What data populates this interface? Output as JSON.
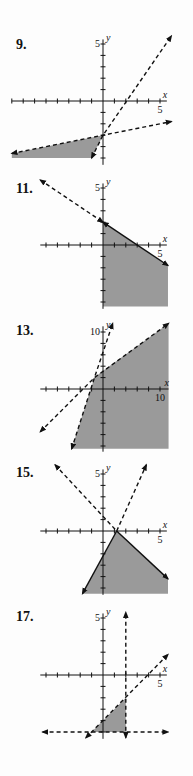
{
  "problems": [
    {
      "number": "9.",
      "top": 37
    },
    {
      "number": "11.",
      "top": 181
    },
    {
      "number": "13.",
      "top": 323
    },
    {
      "number": "15.",
      "top": 465
    },
    {
      "number": "17.",
      "top": 609
    }
  ],
  "style": {
    "shade": "#9a9a9a",
    "line": "#111111"
  },
  "chart_data": [
    {
      "type": "line",
      "title": "9.",
      "xlabel": "x",
      "ylabel": "y",
      "xlim": [
        -8,
        6
      ],
      "ylim": [
        -6,
        5
      ],
      "tick_labels": {
        "x": "5",
        "y": "5"
      },
      "series": [
        {
          "name": "boundary 1",
          "style": "dashed",
          "points": [
            [
              -8,
              -4.6
            ],
            [
              0,
              -3
            ],
            [
              6,
              -1.8
            ]
          ]
        },
        {
          "name": "boundary 2",
          "style": "dashed",
          "points": [
            [
              -1,
              -5
            ],
            [
              0,
              -3
            ],
            [
              6,
              5.7
            ]
          ]
        }
      ],
      "shaded_region": [
        [
          -8,
          -4.6
        ],
        [
          0,
          -3
        ],
        [
          -1,
          -5
        ],
        [
          -8,
          -5
        ]
      ]
    },
    {
      "type": "line",
      "title": "11.",
      "xlabel": "x",
      "ylabel": "y",
      "xlim": [
        -5,
        6
      ],
      "ylim": [
        -5,
        5
      ],
      "tick_labels": {
        "x": "5",
        "y": "5"
      },
      "series": [
        {
          "name": "boundary dashed",
          "style": "dashed",
          "points": [
            [
              -5.5,
              5.7
            ],
            [
              0,
              2
            ]
          ]
        },
        {
          "name": "boundary solid",
          "style": "solid",
          "points": [
            [
              0,
              2
            ],
            [
              5.7,
              -1.8
            ]
          ]
        }
      ],
      "shaded_region": [
        [
          0,
          2
        ],
        [
          5.7,
          -1.8
        ],
        [
          5.7,
          -5.4
        ],
        [
          0,
          -5.4
        ]
      ]
    },
    {
      "type": "line",
      "title": "13.",
      "xlabel": "x",
      "ylabel": "y",
      "xlim": [
        -10,
        12
      ],
      "ylim": [
        -10,
        12
      ],
      "tick_labels": {
        "x": "10",
        "y": "10"
      },
      "series": [
        {
          "name": "steep boundary",
          "style": "dashed",
          "points": [
            [
              -5.5,
              -10.5
            ],
            [
              -1.5,
              2
            ],
            [
              1.7,
              11.5
            ]
          ]
        },
        {
          "name": "shallow boundary",
          "style": "dashed",
          "points": [
            [
              -11,
              -7.5
            ],
            [
              -1.5,
              2
            ],
            [
              11.5,
              11.5
            ]
          ]
        }
      ],
      "shaded_region": [
        [
          -5.5,
          -10.5
        ],
        [
          -1.5,
          2
        ],
        [
          0,
          3.2
        ],
        [
          11.5,
          11.5
        ],
        [
          11.5,
          -10.5
        ]
      ]
    },
    {
      "type": "line",
      "title": "15.",
      "xlabel": "x",
      "ylabel": "y",
      "xlim": [
        -5,
        6
      ],
      "ylim": [
        -6,
        5
      ],
      "tick_labels": {
        "x": "5",
        "y": "5"
      },
      "series": [
        {
          "name": "descending",
          "style": "dashed-solid",
          "points": [
            [
              -4.2,
              5.8
            ],
            [
              1.2,
              0
            ],
            [
              5.7,
              -4.2
            ]
          ]
        },
        {
          "name": "ascending",
          "style": "dashed-solid",
          "points": [
            [
              -1.8,
              -5.5
            ],
            [
              1.2,
              0
            ],
            [
              3.8,
              5.8
            ]
          ]
        }
      ],
      "shaded_region": [
        [
          1.2,
          0
        ],
        [
          5.7,
          -4.2
        ],
        [
          5.7,
          -5.5
        ],
        [
          -1.8,
          -5.5
        ]
      ]
    },
    {
      "type": "line",
      "title": "17.",
      "xlabel": "x",
      "ylabel": "y",
      "xlim": [
        -5,
        6
      ],
      "ylim": [
        -5.5,
        5
      ],
      "tick_labels": {
        "x": "5",
        "y": "5"
      },
      "series": [
        {
          "name": "x = 2",
          "style": "dashed",
          "points": [
            [
              2,
              -5.5
            ],
            [
              2,
              5.5
            ]
          ]
        },
        {
          "name": "y = -5",
          "style": "dashed",
          "points": [
            [
              -5.3,
              -5
            ],
            [
              5.7,
              -5
            ]
          ]
        },
        {
          "name": "diagonal",
          "style": "dashed",
          "points": [
            [
              -1.5,
              -5.5
            ],
            [
              5.7,
              1.8
            ]
          ]
        }
      ],
      "shaded_region": [
        [
          -1,
          -5
        ],
        [
          2,
          -2
        ],
        [
          2,
          -5
        ]
      ]
    }
  ]
}
